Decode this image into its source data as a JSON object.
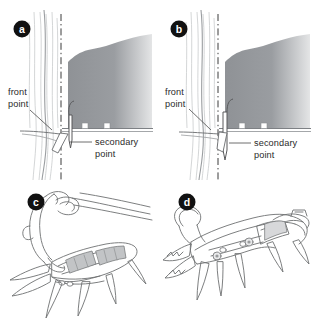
{
  "figure": {
    "type": "technical-illustration",
    "background_color": "#ffffff",
    "ink_color": "#555555",
    "text_color": "#2b2b2b",
    "badge_fill": "#111111",
    "badge_text_color": "#ffffff",
    "ice_color": "#b9bcc0",
    "boot_fill_dark": "#8c8f93",
    "boot_fill_light": "#d9dadc"
  },
  "panels": [
    {
      "id": "a",
      "badge": "a",
      "caption_labels": [
        {
          "name": "front-point",
          "line1": "front",
          "line2": "point"
        },
        {
          "name": "secondary-point",
          "line1": "secondary",
          "line2": "point"
        }
      ],
      "elements": [
        "ice-wall",
        "vertical-reference-line",
        "boot-silhouette",
        "crampon-front-point",
        "crampon-secondary-point",
        "leader-line-front-point",
        "leader-line-secondary-point"
      ]
    },
    {
      "id": "b",
      "badge": "b",
      "caption_labels": [
        {
          "name": "front-point",
          "line1": "front",
          "line2": "point"
        },
        {
          "name": "secondary-point",
          "line1": "secondary",
          "line2": "point"
        }
      ],
      "elements": [
        "ice-wall",
        "vertical-reference-line",
        "boot-silhouette",
        "crampon-front-point",
        "crampon-secondary-point",
        "leader-line-front-point",
        "leader-line-secondary-point"
      ]
    },
    {
      "id": "c",
      "badge": "c",
      "caption_labels": [],
      "elements": [
        "crampon-body",
        "heel-bail",
        "toe-bail",
        "front-points",
        "secondary-points",
        "binding-strap",
        "anti-balling-plate"
      ]
    },
    {
      "id": "d",
      "badge": "d",
      "caption_labels": [],
      "elements": [
        "crampon-body",
        "heel-lever",
        "toe-bail",
        "front-points",
        "secondary-points",
        "center-bar",
        "adjustment-holes"
      ]
    }
  ]
}
